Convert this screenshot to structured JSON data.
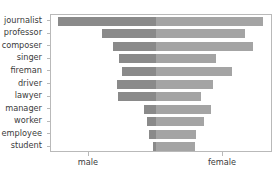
{
  "chart_data": {
    "type": "bar",
    "subtype": "diverging-population-pyramid",
    "title": "",
    "xlabel": "",
    "ylabel": "",
    "orientation": "horizontal",
    "grid": false,
    "legend": "none",
    "categories": [
      "journalist",
      "professor",
      "composer",
      "singer",
      "fireman",
      "driver",
      "lawyer",
      "manager",
      "worker",
      "employee",
      "student"
    ],
    "xtick_labels": [
      "male",
      "female"
    ],
    "xtick_values": [
      -1,
      1
    ],
    "xlim": [
      -1.57,
      1.75
    ],
    "series": [
      {
        "name": "male",
        "direction": "left",
        "color": "#8a8a8a",
        "values": [
          1.46,
          0.81,
          0.64,
          0.55,
          0.51,
          0.58,
          0.57,
          0.18,
          0.13,
          0.1,
          0.04
        ]
      },
      {
        "name": "female",
        "direction": "right",
        "color": "#a4a4a4",
        "values": [
          1.6,
          1.33,
          1.45,
          0.9,
          1.13,
          0.85,
          0.67,
          0.82,
          0.72,
          0.6,
          0.58
        ]
      }
    ]
  },
  "figure": {
    "background_color": "#ffffff",
    "frame_color": "#b9b9b9",
    "tick_color": "#b9b9b9",
    "text_color": "#3b3b3b"
  }
}
